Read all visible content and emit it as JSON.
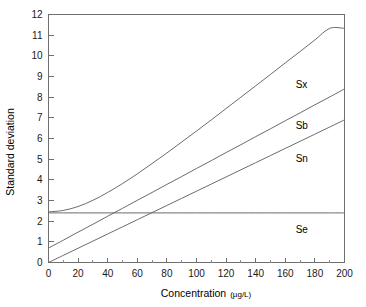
{
  "chart_data": {
    "type": "line",
    "title": "",
    "xlabel": "Concentration",
    "xunits": "(µg/L)",
    "ylabel": "Standard deviation",
    "xlim": [
      0,
      200
    ],
    "ylim": [
      0,
      12
    ],
    "grid": false,
    "legend_position": "inline-right",
    "x_major_ticks": [
      0,
      20,
      40,
      60,
      80,
      100,
      120,
      140,
      160,
      180,
      200
    ],
    "x_minor_step": 10,
    "y_major_ticks": [
      0,
      1,
      2,
      3,
      4,
      5,
      6,
      7,
      8,
      9,
      10,
      11,
      12
    ],
    "x_tick_labels": [
      "0",
      "20",
      "40",
      "60",
      "80",
      "100",
      "120",
      "140",
      "160",
      "180",
      "200"
    ],
    "y_tick_labels": [
      "0",
      "1",
      "2",
      "3",
      "4",
      "5",
      "6",
      "7",
      "8",
      "9",
      "10",
      "11",
      "12"
    ],
    "x": [
      0,
      10,
      20,
      30,
      40,
      50,
      60,
      70,
      80,
      90,
      100,
      110,
      120,
      130,
      140,
      150,
      160,
      170,
      180,
      190,
      200
    ],
    "series": [
      {
        "name": "Sx",
        "label": "Sx",
        "label_x": 167,
        "label_y": 8.62,
        "values": [
          2.45,
          2.52,
          2.71,
          3.01,
          3.39,
          3.82,
          4.29,
          4.79,
          5.3,
          5.83,
          6.36,
          6.9,
          7.45,
          8.0,
          8.55,
          9.1,
          9.66,
          10.21,
          10.77,
          11.33,
          11.33
        ]
      },
      {
        "name": "Sb",
        "label": "Sb",
        "label_x": 167,
        "label_y": 6.62,
        "values": [
          0.7,
          1.08,
          1.47,
          1.85,
          2.24,
          2.62,
          3.01,
          3.39,
          3.78,
          4.16,
          4.55,
          4.93,
          5.32,
          5.7,
          6.09,
          6.47,
          6.86,
          7.24,
          7.63,
          8.01,
          8.4
        ]
      },
      {
        "name": "Sn",
        "label": "Sn",
        "label_x": 167,
        "label_y": 5.05,
        "values": [
          0.0,
          0.345,
          0.69,
          1.035,
          1.38,
          1.725,
          2.07,
          2.415,
          2.76,
          3.105,
          3.45,
          3.795,
          4.14,
          4.485,
          4.83,
          5.175,
          5.52,
          5.865,
          6.21,
          6.555,
          6.9
        ]
      },
      {
        "name": "Se",
        "label": "Se",
        "label_x": 167,
        "label_y": 1.62,
        "values": [
          2.4,
          2.4,
          2.4,
          2.4,
          2.4,
          2.4,
          2.4,
          2.4,
          2.4,
          2.4,
          2.4,
          2.4,
          2.4,
          2.4,
          2.4,
          2.4,
          2.4,
          2.4,
          2.4,
          2.4,
          2.4
        ]
      }
    ]
  }
}
